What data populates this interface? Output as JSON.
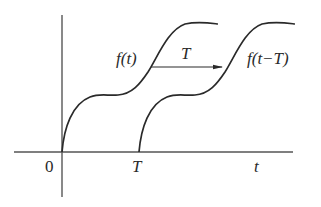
{
  "diagram": {
    "axes": {
      "origin_label": "0",
      "x_axis_label": "t",
      "shift_tick_label": "T"
    },
    "curves": [
      {
        "name": "original",
        "label": "f(t)",
        "start_x": 0
      },
      {
        "name": "shifted",
        "label": "f(t−T)",
        "start_x": "T"
      }
    ],
    "shift_arrow": {
      "label": "T",
      "direction": "right"
    },
    "colors": {
      "line": "#2a2a2a",
      "axis": "#555555",
      "background": "#ffffff"
    }
  }
}
